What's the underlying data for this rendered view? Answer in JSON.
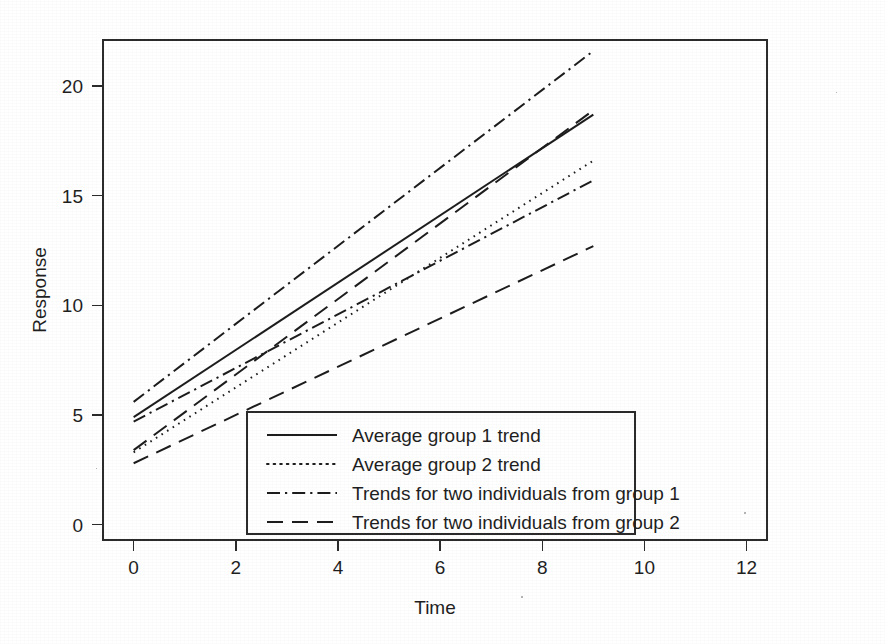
{
  "chart_data": {
    "type": "line",
    "title": "",
    "xlabel": "Time",
    "ylabel": "Response",
    "xlim": [
      -0.6,
      12.4
    ],
    "ylim": [
      -0.7,
      22.1
    ],
    "xticks": [
      0,
      2,
      4,
      6,
      8,
      10,
      12
    ],
    "xtick_labels": [
      "0",
      "2",
      "4",
      "6",
      "8",
      "10",
      "12"
    ],
    "yticks": [
      0,
      5,
      10,
      15,
      20
    ],
    "ytick_labels": [
      "0",
      "5",
      "10",
      "15",
      "20"
    ],
    "grid": false,
    "frame": true,
    "legend_position": "lower-center-right inside axes",
    "x": [
      0,
      9
    ],
    "series": [
      {
        "name": "Average group 1 trend",
        "style": "solid",
        "legend_key": "avg-group-1",
        "values": [
          4.9,
          18.7
        ],
        "intercept": 4.9,
        "slope": 1.533
      },
      {
        "name": "Average group 2 trend",
        "style": "dotted",
        "legend_key": "avg-group-2",
        "values": [
          3.3,
          16.6
        ],
        "intercept": 3.3,
        "slope": 1.478
      },
      {
        "name": "Trends for two individuals from group 1",
        "style": "dash-dot",
        "legend_key": "individuals-group-1",
        "values": [
          5.6,
          21.6
        ],
        "intercept": 5.6,
        "slope": 1.778
      },
      {
        "name": "Trends for two individuals from group 1",
        "style": "dash-dot",
        "legend_key": "individuals-group-1",
        "values": [
          4.7,
          15.7
        ],
        "intercept": 4.7,
        "slope": 1.222
      },
      {
        "name": "Trends for two individuals from group 2",
        "style": "dashed",
        "legend_key": "individuals-group-2",
        "values": [
          3.4,
          18.9
        ],
        "intercept": 3.4,
        "slope": 1.722
      },
      {
        "name": "Trends for two individuals from group 2",
        "style": "dashed",
        "legend_key": "individuals-group-2",
        "values": [
          2.8,
          12.7
        ],
        "intercept": 2.8,
        "slope": 1.1
      }
    ],
    "legend": [
      {
        "label": "Average group 1 trend",
        "style": "solid"
      },
      {
        "label": "Average group 2 trend",
        "style": "dotted"
      },
      {
        "label": "Trends for two individuals from group 1",
        "style": "dash-dot"
      },
      {
        "label": "Trends for two individuals from group 2",
        "style": "dashed"
      }
    ],
    "colors": {
      "line": "#1d1d1d",
      "axis": "#2b2b2b",
      "text": "#1f1f1f",
      "background": "#ffffff"
    }
  }
}
